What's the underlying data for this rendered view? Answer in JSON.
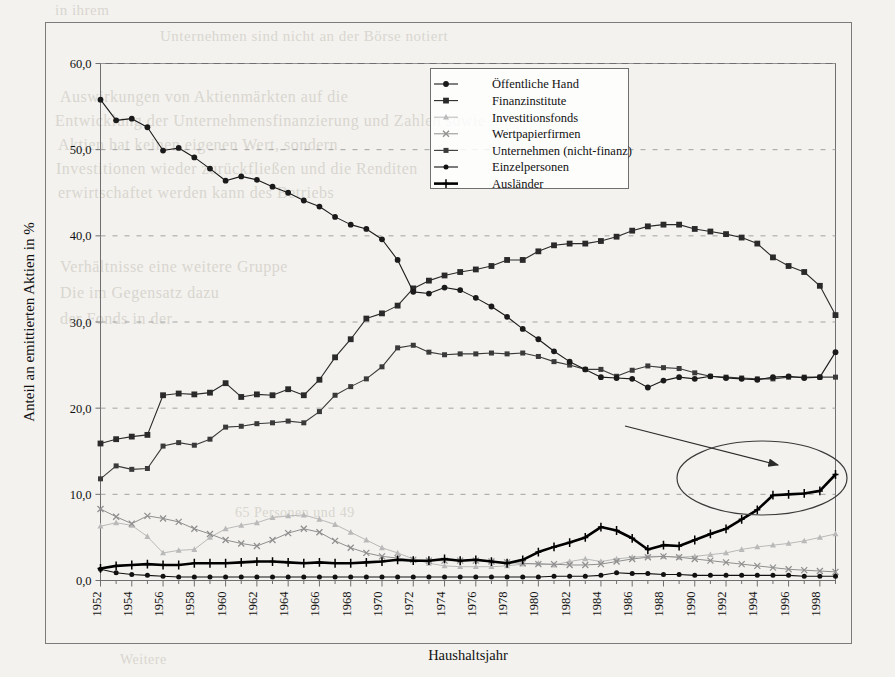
{
  "chart_data": {
    "type": "line",
    "title": "",
    "xlabel": "Haushaltsjahr",
    "ylabel": "Anteil an emittierten Aktien in %",
    "ylim": [
      0,
      60
    ],
    "yticks": [
      "0,0",
      "10,0",
      "20,0",
      "30,0",
      "40,0",
      "50,0",
      "60,0"
    ],
    "ytick_values": [
      0,
      10,
      20,
      30,
      40,
      50,
      60
    ],
    "grid": "horizontal-dashed",
    "legend_position": "top-center",
    "x": [
      1952,
      1953,
      1954,
      1955,
      1956,
      1957,
      1958,
      1959,
      1960,
      1961,
      1962,
      1963,
      1964,
      1965,
      1966,
      1967,
      1968,
      1969,
      1970,
      1971,
      1972,
      1973,
      1974,
      1975,
      1976,
      1977,
      1978,
      1979,
      1980,
      1981,
      1982,
      1983,
      1984,
      1985,
      1986,
      1987,
      1988,
      1989,
      1990,
      1991,
      1992,
      1993,
      1994,
      1995,
      1996,
      1997,
      1998,
      1999
    ],
    "xtick_labels": [
      "1952",
      "1954",
      "1956",
      "1958",
      "1960",
      "1962",
      "1964",
      "1966",
      "1968",
      "1970",
      "1972",
      "1974",
      "1976",
      "1978",
      "1980",
      "1982",
      "1984",
      "1986",
      "1988",
      "1990",
      "1992",
      "1994",
      "1996",
      "1998"
    ],
    "xtick_values": [
      1952,
      1954,
      1956,
      1958,
      1960,
      1962,
      1964,
      1966,
      1968,
      1970,
      1972,
      1974,
      1976,
      1978,
      1980,
      1982,
      1984,
      1986,
      1988,
      1990,
      1992,
      1994,
      1996,
      1998
    ],
    "series": [
      {
        "name": "Öffentliche Hand",
        "marker": "circle",
        "color": "#1a1a1a",
        "width": 1.1,
        "values": [
          55.8,
          53.4,
          53.6,
          52.6,
          49.9,
          50.2,
          49.1,
          47.8,
          46.4,
          46.9,
          46.5,
          45.7,
          45.0,
          44.1,
          43.4,
          42.2,
          41.3,
          40.8,
          39.6,
          37.2,
          33.5,
          33.3,
          34.0,
          33.7,
          32.8,
          31.8,
          30.6,
          29.2,
          28.0,
          26.6,
          25.4,
          24.5,
          23.6,
          23.5,
          23.4,
          22.4,
          23.2,
          23.6,
          23.4,
          23.7,
          23.5,
          23.4,
          23.3,
          23.6,
          23.7,
          23.5,
          23.6,
          26.5
        ]
      },
      {
        "name": "Finanzinstitute",
        "marker": "square",
        "color": "#2a2a2a",
        "width": 1.1,
        "values": [
          15.9,
          16.4,
          16.7,
          16.9,
          21.5,
          21.7,
          21.6,
          21.8,
          22.9,
          21.3,
          21.6,
          21.5,
          22.2,
          21.5,
          23.3,
          25.9,
          28.0,
          30.4,
          31.0,
          31.9,
          33.9,
          34.8,
          35.4,
          35.8,
          36.1,
          36.5,
          37.2,
          37.2,
          38.2,
          38.9,
          39.1,
          39.1,
          39.4,
          39.9,
          40.6,
          41.1,
          41.3,
          41.3,
          40.8,
          40.5,
          40.2,
          39.8,
          39.1,
          37.5,
          36.5,
          35.8,
          34.2,
          30.8
        ]
      },
      {
        "name": "Investitionsfonds",
        "marker": "triangle",
        "color": "#b9b9b9",
        "width": 1.0,
        "values": [
          6.3,
          6.7,
          6.4,
          5.1,
          3.2,
          3.5,
          3.6,
          5.0,
          6.0,
          6.4,
          6.7,
          7.3,
          7.5,
          7.6,
          7.1,
          6.5,
          5.6,
          4.7,
          3.8,
          3.2,
          2.5,
          2.0,
          1.7,
          1.6,
          1.6,
          1.6,
          1.7,
          1.9,
          2.0,
          1.8,
          2.2,
          2.5,
          2.2,
          2.5,
          2.7,
          2.8,
          2.8,
          2.7,
          2.8,
          3.0,
          3.2,
          3.6,
          3.9,
          4.1,
          4.3,
          4.6,
          5.0,
          5.4
        ]
      },
      {
        "name": "Wertpapierfirmen",
        "marker": "cross-x",
        "color": "#8f8f8f",
        "width": 1.0,
        "values": [
          8.3,
          7.4,
          6.6,
          7.5,
          7.2,
          6.8,
          6.0,
          5.4,
          4.7,
          4.3,
          4.0,
          4.7,
          5.5,
          6.0,
          5.6,
          4.6,
          3.8,
          3.2,
          2.8,
          2.6,
          2.4,
          2.3,
          2.3,
          2.3,
          2.3,
          2.2,
          2.1,
          2.0,
          1.9,
          1.9,
          1.8,
          1.8,
          1.9,
          2.2,
          2.5,
          2.7,
          2.8,
          2.7,
          2.5,
          2.3,
          2.1,
          1.9,
          1.7,
          1.5,
          1.3,
          1.2,
          1.1,
          1.0
        ]
      },
      {
        "name": "Unternehmen (nicht-finanz)",
        "marker": "square-small",
        "color": "#3a3a3a",
        "width": 1.1,
        "values": [
          11.8,
          13.3,
          12.9,
          13.0,
          15.6,
          16.0,
          15.7,
          16.4,
          17.8,
          17.9,
          18.2,
          18.3,
          18.5,
          18.3,
          19.6,
          21.5,
          22.5,
          23.4,
          24.8,
          27.0,
          27.3,
          26.5,
          26.2,
          26.3,
          26.3,
          26.4,
          26.3,
          26.4,
          26.0,
          25.4,
          25.0,
          24.5,
          24.5,
          23.7,
          24.4,
          24.9,
          24.7,
          24.6,
          24.1,
          23.7,
          23.6,
          23.5,
          23.4,
          23.4,
          23.6,
          23.6,
          23.6,
          23.6
        ]
      },
      {
        "name": "Einzelpersonen",
        "marker": "circle-small",
        "color": "#111111",
        "width": 1.1,
        "values": [
          1.3,
          0.9,
          0.7,
          0.6,
          0.5,
          0.4,
          0.4,
          0.4,
          0.4,
          0.4,
          0.4,
          0.4,
          0.4,
          0.4,
          0.4,
          0.4,
          0.4,
          0.4,
          0.4,
          0.4,
          0.4,
          0.4,
          0.4,
          0.4,
          0.4,
          0.4,
          0.4,
          0.4,
          0.4,
          0.5,
          0.5,
          0.5,
          0.6,
          0.9,
          0.8,
          0.8,
          0.7,
          0.7,
          0.6,
          0.6,
          0.6,
          0.6,
          0.6,
          0.6,
          0.6,
          0.5,
          0.5,
          0.5
        ]
      },
      {
        "name": "Ausländer",
        "marker": "plus",
        "color": "#000000",
        "width": 2.6,
        "values": [
          1.4,
          1.7,
          1.8,
          1.9,
          1.8,
          1.8,
          2.0,
          2.0,
          2.0,
          2.1,
          2.2,
          2.2,
          2.1,
          2.0,
          2.1,
          2.0,
          2.0,
          2.1,
          2.2,
          2.4,
          2.3,
          2.3,
          2.5,
          2.3,
          2.4,
          2.2,
          2.0,
          2.4,
          3.3,
          3.9,
          4.4,
          5.0,
          6.2,
          5.8,
          4.9,
          3.6,
          4.1,
          4.0,
          4.7,
          5.4,
          6.0,
          7.1,
          8.2,
          9.9,
          10.0,
          10.1,
          10.4,
          12.3
        ]
      }
    ],
    "annotations": [
      {
        "kind": "ellipse",
        "label": "highlight-ellipse",
        "note": "Hervorhebung des Ausländer-Anstiegs 1994-1999"
      },
      {
        "kind": "arrow",
        "label": "highlight-arrow",
        "note": "Pfeil zeigt auf Hervorhebung"
      }
    ]
  },
  "legend": {
    "items": [
      {
        "label": "Öffentliche Hand"
      },
      {
        "label": "Finanzinstitute"
      },
      {
        "label": "Investitionsfonds"
      },
      {
        "label": "Wertpapierfirmen"
      },
      {
        "label": "Unternehmen (nicht-finanz)"
      },
      {
        "label": "Einzelpersonen"
      },
      {
        "label": "Ausländer"
      }
    ]
  },
  "axes": {
    "y_title": "Anteil an emittierten Aktien in %",
    "x_title": "Haushaltsjahr"
  },
  "background_text": {
    "lines": [
      "in ihrem",
      "Unternehmen sind nicht an der Börse notiert",
      "Auswirkungen von Aktienmärkten auf die",
      "Entwicklung der Unternehmensfinanzierung und Zahlen sowie",
      "Aktien hat keinen eigenen Wert, sondern",
      "Investitionen wieder zurückfließen und die Renditen",
      "erwirtschaftet werden kann des Betriebs",
      "Verhältnisse eine weitere Gruppe",
      "Die im Gegensatz dazu",
      "der Fonds in der",
      "65 Personen und 49",
      "Weitere"
    ]
  }
}
